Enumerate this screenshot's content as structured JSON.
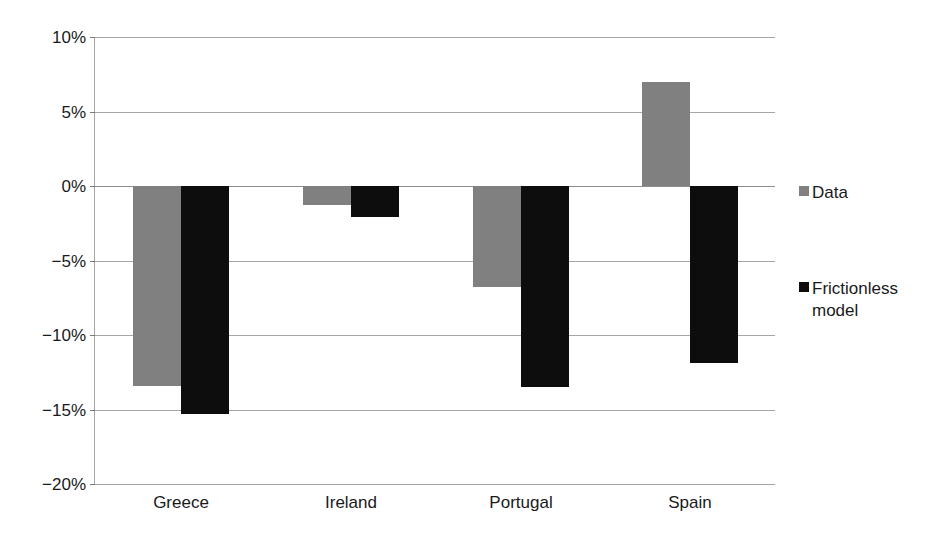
{
  "chart_data": {
    "type": "bar",
    "title": "",
    "subtitle": "",
    "xlabel": "",
    "ylabel": "",
    "categories": [
      "Greece",
      "Ireland",
      "Portugal",
      "Spain"
    ],
    "series": [
      {
        "name": "Data",
        "color": "#808080",
        "values": [
          -13.4,
          -1.3,
          -6.8,
          7.0
        ]
      },
      {
        "name": "Frictionless model",
        "color": "#0d0d0d",
        "values": [
          -15.3,
          -2.1,
          -13.5,
          -11.9
        ]
      }
    ],
    "ylim": [
      -20,
      10
    ],
    "ytick_values": [
      10,
      5,
      0,
      -5,
      -10,
      -15,
      -20
    ],
    "ytick_labels": [
      "10%",
      "5%",
      "0%",
      "−5%",
      "−10%",
      "−15%",
      "−20%"
    ],
    "grid": true,
    "legend_position": "right",
    "value_unit": "%",
    "zero_line": 0
  },
  "legend": {
    "entries": [
      {
        "label": "Data"
      },
      {
        "label": "Frictionless\nmodel"
      }
    ]
  },
  "axis": {
    "y_labels": [
      "10%",
      "5%",
      "0%",
      "−5%",
      "−10%",
      "−15%",
      "−20%"
    ],
    "x_labels": [
      "Greece",
      "Ireland",
      "Portugal",
      "Spain"
    ]
  }
}
